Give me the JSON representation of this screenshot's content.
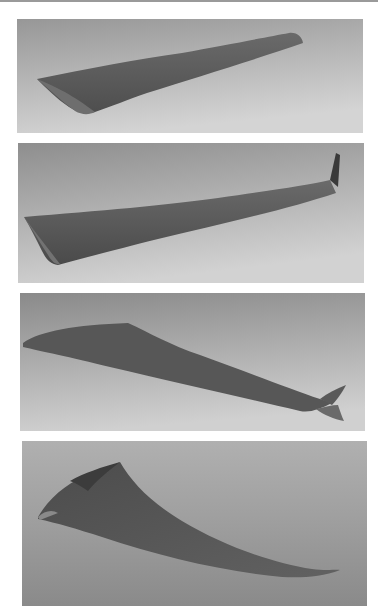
{
  "figure": {
    "panel_count": 4,
    "panels": [
      {
        "index": 1,
        "subject": "tapered straight wing, rounded tip",
        "bg_top": "#9a9a9a",
        "bg_bottom": "#d2d2d2",
        "wing_color": "#5f5f5f"
      },
      {
        "index": 2,
        "subject": "long straight wing with small vertical winglet",
        "bg_top": "#8f8f8f",
        "bg_bottom": "#d0d0d0",
        "wing_color": "#5a5a5a"
      },
      {
        "index": 3,
        "subject": "swept cranked wing with tip fin",
        "bg_top": "#8c8c8c",
        "bg_bottom": "#cfcfcf",
        "wing_color": "#555555"
      },
      {
        "index": 4,
        "subject": "twisted high-aspect curved wing",
        "bg_top": "#a8a8a8",
        "bg_bottom": "#8e8e8e",
        "wing_color": "#5e5e5e"
      }
    ]
  }
}
